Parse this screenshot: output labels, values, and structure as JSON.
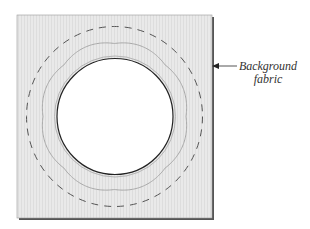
{
  "diagram": {
    "callout": {
      "line1": "Background",
      "line2": "fabric"
    },
    "shapes": {
      "fabric_square": {
        "x": 17,
        "y": 15,
        "w": 195,
        "h": 203,
        "fill": "#e8e8e8",
        "edge": "#555555"
      },
      "dashed_circle": {
        "cx": 114.5,
        "cy": 116.5,
        "rx": 88,
        "ry": 90,
        "stroke": "#555555"
      },
      "scalloped_ring": {
        "cx": 114.5,
        "cy": 116.5,
        "r": 74,
        "lobes": 8,
        "stroke": "#aaaaaa"
      },
      "inner_circle": {
        "cx": 115,
        "cy": 116.5,
        "r": 58,
        "fill": "#ffffff",
        "stroke": "#222222",
        "halo": "#b5b5b5"
      }
    },
    "colors": {
      "fabric": "#e8e8e8",
      "outline": "#222222",
      "dash": "#555555",
      "scallop": "#aaaaaa"
    }
  }
}
